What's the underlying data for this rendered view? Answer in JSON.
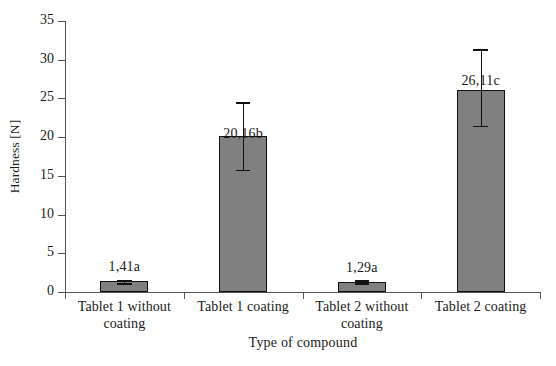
{
  "chart_data": {
    "type": "bar",
    "title": "",
    "xlabel": "Type of compound",
    "ylabel": "Hardness [N]",
    "categories": [
      "Tablet 1 without coating",
      "Tablet 1 coating",
      "Tablet 2 without coating",
      "Tablet 2 coating"
    ],
    "values": [
      1.41,
      20.16,
      1.29,
      26.11
    ],
    "data_labels": [
      "1,41a",
      "20,16b",
      "1,29a",
      "26,11c"
    ],
    "error_low": [
      1.2,
      15.8,
      1.15,
      21.5
    ],
    "error_high": [
      1.6,
      24.5,
      1.5,
      31.4
    ],
    "ylim": [
      0,
      35
    ],
    "ytick_labels": [
      "0",
      "5",
      "10",
      "15",
      "20",
      "25",
      "30",
      "35"
    ],
    "ytick_values": [
      0,
      5,
      10,
      15,
      20,
      25,
      30,
      35
    ],
    "ytick_interval": 5,
    "grid": false,
    "legend": "none",
    "bar_color": "#808080",
    "bar_edge_color": "#111111",
    "error_bar_color": "#111111",
    "axis_color": "#555555",
    "background_color": "#ffffff"
  }
}
